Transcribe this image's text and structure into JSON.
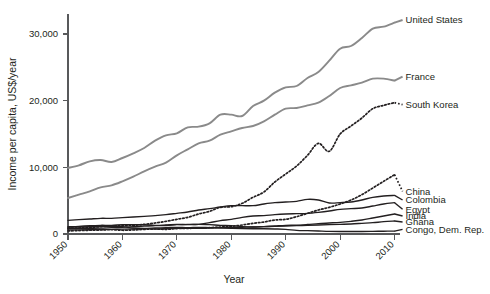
{
  "chart_data": {
    "type": "line",
    "title": "",
    "xlabel": "Year",
    "ylabel": "Income per capita, US$/year",
    "xlim": [
      1950,
      2011
    ],
    "ylim": [
      0,
      33000
    ],
    "xticks": [
      1950,
      1960,
      1970,
      1980,
      1990,
      2000,
      2010
    ],
    "xticklabels": [
      "1950",
      "1960",
      "1970",
      "1980",
      "1990",
      "2000",
      "2010"
    ],
    "yticks": [
      0,
      10000,
      20000,
      30000
    ],
    "yticklabels": [
      "0",
      "10,000",
      "20,000",
      "30,000"
    ],
    "grid": false,
    "legend_position": "right-inline-labels",
    "x": [
      1950,
      1952,
      1954,
      1956,
      1958,
      1960,
      1962,
      1964,
      1966,
      1968,
      1970,
      1972,
      1974,
      1976,
      1978,
      1980,
      1982,
      1984,
      1986,
      1988,
      1990,
      1992,
      1994,
      1996,
      1998,
      2000,
      2002,
      2004,
      2006,
      2008,
      2010
    ],
    "series": [
      {
        "name": "United States",
        "label": "United States",
        "color": "#8a8a8a",
        "style": "solid",
        "width": 1.9,
        "label_y_value": 32100,
        "values": [
          9900,
          10300,
          10900,
          11100,
          10800,
          11400,
          12100,
          12900,
          14000,
          14800,
          15100,
          16000,
          16100,
          16600,
          17900,
          17900,
          17700,
          19200,
          20000,
          21200,
          22000,
          22200,
          23400,
          24300,
          26000,
          27800,
          28200,
          29400,
          30800,
          31100,
          31700
        ]
      },
      {
        "name": "France",
        "label": "France",
        "color": "#8a8a8a",
        "style": "solid",
        "width": 1.9,
        "label_y_value": 23600,
        "values": [
          5400,
          5900,
          6400,
          7000,
          7300,
          7900,
          8600,
          9400,
          10100,
          10700,
          11800,
          12700,
          13600,
          14000,
          14900,
          15400,
          15900,
          16200,
          16900,
          17900,
          18800,
          18900,
          19300,
          19700,
          20700,
          21900,
          22300,
          22700,
          23300,
          23300,
          23000
        ]
      },
      {
        "name": "South Korea",
        "label": "South Korea",
        "color": "#231f20",
        "style": "dotted",
        "width": 1.7,
        "label_y_value": 19400,
        "values": [
          860,
          900,
          1000,
          1100,
          1200,
          1250,
          1300,
          1450,
          1650,
          1900,
          2200,
          2500,
          3000,
          3400,
          4000,
          4100,
          4600,
          5500,
          6300,
          7800,
          9000,
          10200,
          11800,
          13600,
          12400,
          15000,
          16200,
          17400,
          18800,
          19300,
          19700
        ]
      },
      {
        "name": "China",
        "label": "China",
        "color": "#231f20",
        "style": "dotted",
        "width": 1.7,
        "label_y_value": 6400,
        "values": [
          450,
          520,
          560,
          600,
          640,
          560,
          600,
          700,
          750,
          700,
          820,
          850,
          880,
          950,
          1050,
          1150,
          1350,
          1600,
          1800,
          2100,
          2200,
          2600,
          3100,
          3600,
          4000,
          4500,
          5100,
          5900,
          6900,
          7900,
          8900
        ]
      },
      {
        "name": "Colombia",
        "label": "Colombia",
        "color": "#231f20",
        "style": "solid",
        "width": 1.4,
        "label_y_value": 5100,
        "values": [
          2050,
          2150,
          2250,
          2350,
          2350,
          2450,
          2550,
          2650,
          2750,
          2900,
          3100,
          3300,
          3600,
          3800,
          4050,
          4250,
          4250,
          4250,
          4500,
          4700,
          4800,
          4900,
          5200,
          5100,
          4650,
          4700,
          4800,
          5100,
          5500,
          5700,
          5800
        ]
      },
      {
        "name": "Egypt",
        "label": "Egypt",
        "color": "#231f20",
        "style": "solid",
        "width": 1.4,
        "label_y_value": 3700,
        "values": [
          800,
          820,
          850,
          880,
          950,
          1000,
          1100,
          1200,
          1250,
          1280,
          1400,
          1450,
          1450,
          1700,
          2000,
          2200,
          2500,
          2700,
          2750,
          2900,
          3000,
          3050,
          3100,
          3250,
          3450,
          3700,
          3800,
          3900,
          4200,
          4500,
          4700
        ]
      },
      {
        "name": "India",
        "label": "India",
        "color": "#231f20",
        "style": "solid",
        "width": 1.4,
        "label_y_value": 2700,
        "values": [
          600,
          620,
          650,
          680,
          700,
          730,
          740,
          780,
          760,
          800,
          860,
          840,
          870,
          880,
          950,
          940,
          1000,
          1060,
          1100,
          1200,
          1300,
          1320,
          1420,
          1550,
          1650,
          1750,
          1900,
          2100,
          2400,
          2700,
          3000
        ]
      },
      {
        "name": "Ghana",
        "label": "Ghana",
        "color": "#231f20",
        "style": "solid",
        "width": 1.4,
        "label_y_value": 1800,
        "values": [
          1100,
          1150,
          1250,
          1300,
          1300,
          1400,
          1400,
          1400,
          1300,
          1350,
          1450,
          1400,
          1450,
          1400,
          1300,
          1250,
          1100,
          1050,
          1100,
          1150,
          1200,
          1250,
          1300,
          1350,
          1400,
          1450,
          1500,
          1600,
          1700,
          1850,
          1950
        ]
      },
      {
        "name": "Congo, Dem. Rep.",
        "label": "Congo, Dem. Rep.",
        "color": "#231f20",
        "style": "solid",
        "width": 1.4,
        "label_y_value": 700,
        "values": [
          1000,
          1050,
          1100,
          1150,
          1150,
          1100,
          900,
          850,
          900,
          950,
          1000,
          950,
          1000,
          950,
          900,
          850,
          800,
          780,
          780,
          750,
          700,
          550,
          500,
          450,
          400,
          380,
          370,
          380,
          400,
          420,
          430
        ]
      }
    ]
  }
}
